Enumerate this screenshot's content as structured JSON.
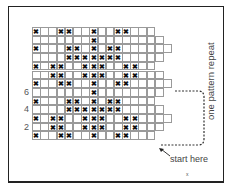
{
  "diagram": {
    "title": "",
    "annotations": {
      "repeat_label": "one pattern repeat",
      "start_label": "start here",
      "footnote": "x"
    },
    "row_labels": [
      {
        "row": 8,
        "text": "6"
      },
      {
        "row": 10,
        "text": "4"
      },
      {
        "row": 12,
        "text": "2"
      }
    ],
    "colors": {
      "grid": "#9a9a9a",
      "cross": "#111111",
      "frame": "#222222",
      "bracket": "#333333"
    },
    "rows": [
      {
        "width": 15,
        "x": [
          1,
          4,
          5,
          8,
          11,
          12
        ]
      },
      {
        "width": 16,
        "x": [
          8
        ]
      },
      {
        "width": 17,
        "x": [
          1,
          5,
          6,
          8,
          10,
          11
        ]
      },
      {
        "width": 16,
        "x": [
          5,
          6,
          7,
          8,
          9,
          10,
          11
        ]
      },
      {
        "width": 15,
        "x": [
          1,
          3,
          4,
          7,
          8,
          9,
          12,
          13
        ]
      },
      {
        "width": 16,
        "x": [
          3,
          4,
          7,
          8,
          9,
          12,
          13
        ]
      },
      {
        "width": 17,
        "x": [
          1,
          4,
          5,
          8,
          11,
          12
        ]
      },
      {
        "width": 16,
        "x": [
          8
        ]
      },
      {
        "width": 15,
        "x": [
          1,
          5,
          6,
          8,
          10,
          11
        ]
      },
      {
        "width": 16,
        "x": [
          5,
          6,
          7,
          8,
          9,
          10,
          11
        ]
      },
      {
        "width": 17,
        "x": [
          1,
          3,
          4,
          7,
          8,
          9,
          12,
          13
        ]
      },
      {
        "width": 16,
        "x": [
          3,
          4,
          7,
          8,
          9,
          12,
          13
        ]
      },
      {
        "width": 15,
        "x": [
          1,
          4,
          5,
          8,
          11,
          12
        ]
      }
    ]
  }
}
